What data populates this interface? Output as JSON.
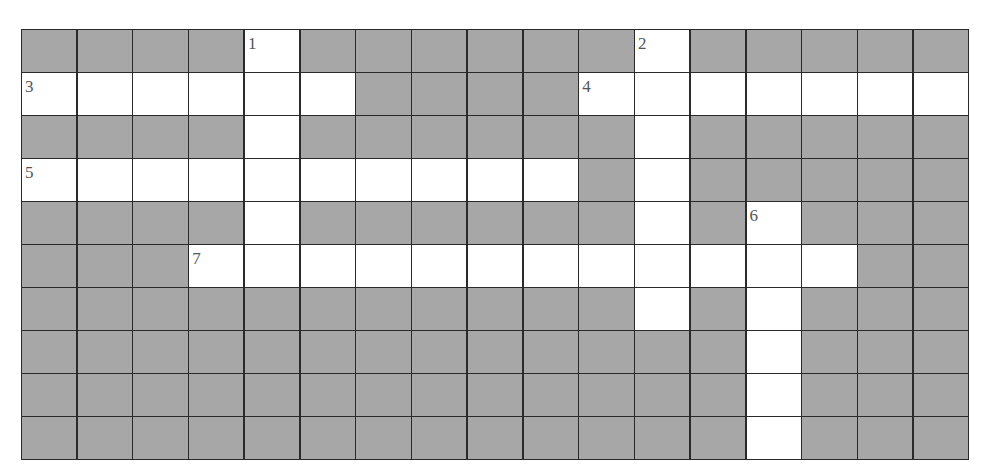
{
  "puzzle": {
    "type": "crossword",
    "columns": 17,
    "rows": 10,
    "colors": {
      "blocked": "#a7a7a7",
      "open": "#ffffff",
      "grid_line": "#2a2a2a",
      "number": "#555555"
    },
    "layout": [
      "....1......2.....",
      "3.....?...4......",
      "....?......?.....",
      "5.........?.?....",
      "....?......?.6...",
      "...7............?",
      "...........?.?...",
      ".............?...",
      ".............?...",
      ".............?..."
    ],
    "entries": [
      {
        "number": "1",
        "direction": "down",
        "row": 0,
        "col": 4,
        "length": 5
      },
      {
        "number": "2",
        "direction": "down",
        "row": 0,
        "col": 11,
        "length": 7
      },
      {
        "number": "3",
        "direction": "across",
        "row": 1,
        "col": 0,
        "length": 6
      },
      {
        "number": "4",
        "direction": "across",
        "row": 1,
        "col": 10,
        "length": 7
      },
      {
        "number": "5",
        "direction": "across",
        "row": 3,
        "col": 0,
        "length": 10
      },
      {
        "number": "6",
        "direction": "down",
        "row": 4,
        "col": 13,
        "length": 6
      },
      {
        "number": "7",
        "direction": "across",
        "row": 5,
        "col": 3,
        "length": 12
      }
    ]
  }
}
